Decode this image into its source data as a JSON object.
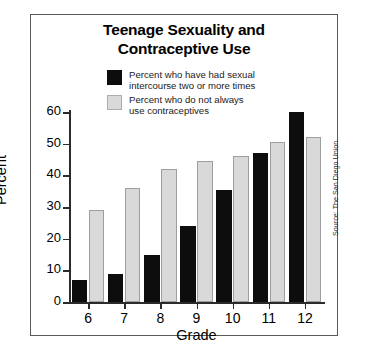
{
  "chart_data": {
    "type": "bar",
    "title": "Teenage Sexuality and Contraceptive Use",
    "title_lines": [
      "Teenage Sexuality and",
      "Contraceptive Use"
    ],
    "xlabel": "Grade",
    "ylabel": "Percent",
    "categories": [
      "6",
      "7",
      "8",
      "9",
      "10",
      "11",
      "12"
    ],
    "ylim": [
      0,
      60
    ],
    "yticks": [
      0,
      10,
      20,
      30,
      40,
      50,
      60
    ],
    "ytick_labels": [
      "0",
      "10",
      "20",
      "30",
      "40",
      "50",
      "60"
    ],
    "grid": false,
    "legend_position": "top-center",
    "series": [
      {
        "name": "Percent who have had sexual intercourse two or more times",
        "name_lines": [
          "Percent who have had sexual",
          "intercourse two or more times"
        ],
        "color": "#0d0d0d",
        "values": [
          7,
          9,
          15,
          24,
          35.5,
          47,
          60
        ]
      },
      {
        "name": "Percent who do not always use contraceptives",
        "name_lines": [
          "Percent who do not always",
          "use contraceptives"
        ],
        "color": "#d9d9d9",
        "values": [
          29,
          36,
          42,
          44.5,
          46,
          50.5,
          52
        ]
      }
    ],
    "source": "Source: The San Diego Union."
  }
}
